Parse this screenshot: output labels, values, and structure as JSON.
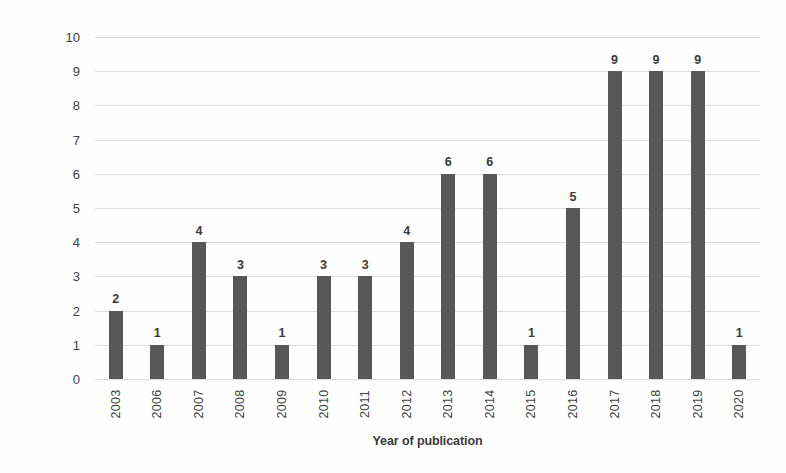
{
  "chart_data": {
    "type": "bar",
    "title": "",
    "subtitle": "",
    "xlabel": "Year of publication",
    "ylabel": "Number of studies",
    "categories": [
      "2003",
      "2006",
      "2007",
      "2008",
      "2009",
      "2010",
      "2011",
      "2012",
      "2013",
      "2014",
      "2015",
      "2016",
      "2017",
      "2018",
      "2019",
      "2020"
    ],
    "values": [
      2,
      1,
      4,
      3,
      1,
      3,
      3,
      4,
      6,
      6,
      1,
      5,
      9,
      9,
      9,
      1
    ],
    "series": [
      {
        "name": "Number of studies",
        "values": [
          2,
          1,
          4,
          3,
          1,
          3,
          3,
          4,
          6,
          6,
          1,
          5,
          9,
          9,
          9,
          1
        ]
      }
    ],
    "data_labels": [
      "2",
      "1",
      "4",
      "3",
      "1",
      "3",
      "3",
      "4",
      "6",
      "6",
      "1",
      "5",
      "9",
      "9",
      "9",
      "1"
    ],
    "ylim": [
      0,
      10
    ],
    "ytick_labels": [
      "10",
      "9",
      "8",
      "7",
      "6",
      "5",
      "4",
      "3",
      "2",
      "1",
      "0"
    ],
    "ytick_values": [
      10,
      9,
      8,
      7,
      6,
      5,
      4,
      3,
      2,
      1,
      0
    ],
    "grid": true,
    "grid_axis": "y",
    "legend": false,
    "legend_position": "none",
    "bar_color": "#585858",
    "grid_color": "#dcdcdc",
    "background_color": "#fefefe",
    "text_color": "#3a3a3a",
    "xtick_rotation": -90,
    "total_studies": 67
  }
}
